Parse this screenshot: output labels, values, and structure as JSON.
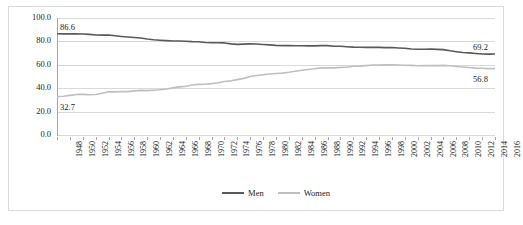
{
  "chart_data": {
    "type": "line",
    "title": "",
    "subtitle": "",
    "xlabel": "",
    "ylabel": "",
    "ylim": [
      0,
      100
    ],
    "ytick_labels": [
      "0.0",
      "20.0",
      "40.0",
      "60.0",
      "80.0",
      "100.0"
    ],
    "ytick_values": [
      0,
      20,
      40,
      60,
      80,
      100
    ],
    "grid": true,
    "legend_position": "bottom-center",
    "x": [
      1948,
      1949,
      1950,
      1951,
      1952,
      1953,
      1954,
      1955,
      1956,
      1957,
      1958,
      1959,
      1960,
      1961,
      1962,
      1963,
      1964,
      1965,
      1966,
      1967,
      1968,
      1969,
      1970,
      1971,
      1972,
      1973,
      1974,
      1975,
      1976,
      1977,
      1978,
      1979,
      1980,
      1981,
      1982,
      1983,
      1984,
      1985,
      1986,
      1987,
      1988,
      1989,
      1990,
      1991,
      1992,
      1993,
      1994,
      1995,
      1996,
      1997,
      1998,
      1999,
      2000,
      2001,
      2002,
      2003,
      2004,
      2005,
      2006,
      2007,
      2008,
      2009,
      2010,
      2011,
      2012,
      2013,
      2014,
      2015,
      2016
    ],
    "xtick_labels": [
      "1948",
      "1950",
      "1952",
      "1954",
      "1956",
      "1958",
      "1960",
      "1962",
      "1964",
      "1966",
      "1968",
      "1970",
      "1972",
      "1974",
      "1976",
      "1978",
      "1980",
      "1982",
      "1984",
      "1986",
      "1988",
      "1990",
      "1992",
      "1994",
      "1996",
      "1998",
      "2000",
      "2002",
      "2004",
      "2006",
      "2008",
      "2010",
      "2012",
      "2014",
      "2016"
    ],
    "xtick_step_years": 2,
    "series": [
      {
        "name": "Men",
        "color": "#595959",
        "values": [
          86.6,
          86.4,
          86.4,
          86.5,
          86.3,
          86.0,
          85.5,
          85.4,
          85.5,
          84.8,
          84.2,
          83.7,
          83.3,
          82.9,
          82.0,
          81.4,
          81.0,
          80.7,
          80.4,
          80.4,
          80.1,
          79.8,
          79.7,
          79.1,
          78.9,
          78.8,
          78.7,
          77.9,
          77.5,
          77.7,
          77.9,
          77.8,
          77.4,
          77.0,
          76.6,
          76.4,
          76.4,
          76.3,
          76.3,
          76.2,
          76.2,
          76.4,
          76.4,
          75.8,
          75.8,
          75.4,
          75.1,
          75.0,
          74.9,
          75.0,
          74.9,
          74.7,
          74.8,
          74.4,
          74.1,
          73.5,
          73.3,
          73.3,
          73.5,
          73.2,
          73.0,
          72.0,
          71.2,
          70.5,
          70.2,
          69.7,
          69.2,
          69.1,
          69.2
        ],
        "start_label": "86.6",
        "end_label": "69.2"
      },
      {
        "name": "Women",
        "color": "#bfbfbf",
        "values": [
          32.7,
          33.1,
          33.9,
          34.6,
          34.7,
          34.4,
          34.6,
          35.7,
          36.9,
          36.9,
          37.1,
          37.1,
          37.7,
          38.1,
          37.9,
          38.3,
          38.7,
          39.3,
          40.3,
          41.1,
          41.6,
          42.7,
          43.3,
          43.4,
          43.9,
          44.7,
          45.7,
          46.3,
          47.3,
          48.4,
          50.0,
          50.9,
          51.5,
          52.1,
          52.6,
          52.9,
          53.6,
          54.5,
          55.3,
          56.0,
          56.6,
          57.4,
          57.5,
          57.4,
          57.8,
          57.9,
          58.8,
          58.9,
          59.3,
          59.8,
          59.8,
          60.0,
          59.9,
          59.8,
          59.6,
          59.5,
          59.2,
          59.3,
          59.4,
          59.3,
          59.5,
          59.2,
          58.6,
          58.1,
          57.7,
          57.2,
          57.0,
          56.7,
          56.8
        ],
        "start_label": "32.7",
        "end_label": "56.8"
      }
    ],
    "annotations": [
      {
        "text": "86.6",
        "series": "Men",
        "position": "start-above"
      },
      {
        "text": "32.7",
        "series": "Women",
        "position": "start-below"
      },
      {
        "text": "69.2",
        "series": "Men",
        "position": "end-above"
      },
      {
        "text": "56.8",
        "series": "Women",
        "position": "end-below"
      }
    ]
  },
  "legend": {
    "items": [
      {
        "label": "Men",
        "color": "#595959"
      },
      {
        "label": "Women",
        "color": "#bfbfbf"
      }
    ]
  }
}
